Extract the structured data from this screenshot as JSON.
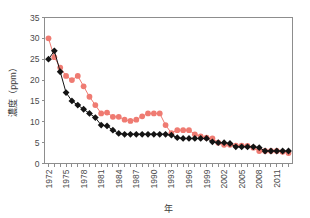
{
  "chart_data": {
    "type": "line",
    "title": "",
    "xlabel": "年",
    "ylabel": "濃度（ppm）",
    "ylim": [
      0,
      35
    ],
    "xlim": [
      1972,
      2013
    ],
    "yticks": [
      0,
      5,
      10,
      15,
      20,
      25,
      30,
      35
    ],
    "ytick_labels": [
      "0",
      "5",
      "10",
      "15",
      "20",
      "25",
      "30",
      "35"
    ],
    "x": [
      1972,
      1973,
      1974,
      1975,
      1976,
      1977,
      1978,
      1979,
      1980,
      1981,
      1982,
      1983,
      1984,
      1985,
      1986,
      1987,
      1988,
      1989,
      1990,
      1991,
      1992,
      1993,
      1994,
      1995,
      1996,
      1997,
      1998,
      1999,
      2000,
      2001,
      2002,
      2003,
      2004,
      2005,
      2006,
      2007,
      2008,
      2009,
      2010,
      2011,
      2012,
      2013
    ],
    "xtick_labels": [
      "1972",
      "1975",
      "1978",
      "1981",
      "1984",
      "1987",
      "1990",
      "1993",
      "1996",
      "1999",
      "2002",
      "2005",
      "2008",
      "2011"
    ],
    "xtick_values": [
      1972,
      1975,
      1978,
      1981,
      1984,
      1987,
      1990,
      1993,
      1996,
      1999,
      2002,
      2005,
      2008,
      2011
    ],
    "grid": false,
    "legend": "none",
    "series": [
      {
        "name": "red-series",
        "color": "#ef7b72",
        "marker": "circle",
        "values": [
          30.0,
          25.5,
          23.0,
          21.0,
          20.0,
          21.0,
          18.5,
          16.0,
          14.0,
          12.0,
          12.2,
          11.2,
          11.2,
          10.5,
          10.2,
          10.5,
          11.3,
          12.0,
          12.0,
          12.0,
          9.2,
          7.3,
          8.0,
          8.0,
          8.0,
          7.0,
          6.5,
          6.2,
          6.0,
          5.0,
          4.5,
          4.5,
          4.3,
          4.3,
          4.2,
          3.8,
          3.0,
          3.0,
          3.0,
          3.0,
          2.8,
          2.5
        ]
      },
      {
        "name": "black-series",
        "color": "#141414",
        "marker": "diamond",
        "values": [
          25.0,
          27.0,
          22.0,
          17.0,
          15.0,
          14.0,
          13.0,
          12.0,
          11.0,
          9.2,
          9.0,
          8.0,
          7.2,
          7.0,
          7.0,
          7.0,
          7.0,
          7.0,
          7.0,
          7.0,
          7.0,
          6.8,
          6.2,
          6.0,
          6.0,
          6.0,
          6.0,
          6.0,
          5.2,
          5.0,
          5.0,
          4.8,
          4.0,
          4.0,
          4.0,
          4.0,
          3.8,
          3.0,
          3.0,
          3.0,
          3.0,
          3.0
        ]
      }
    ]
  },
  "axes": {
    "x_title": "年",
    "y_title": "濃度（ppm）"
  },
  "colors": {
    "red": "#ef7b72",
    "black": "#141414",
    "axis": "#8d8d8d",
    "text": "#4a4a4a",
    "background": "#ffffff"
  }
}
